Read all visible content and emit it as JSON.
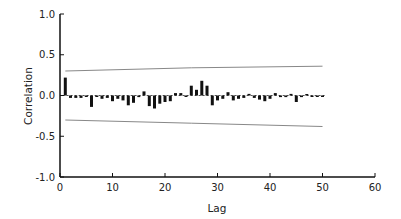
{
  "chart_data": {
    "type": "bar",
    "title": "",
    "xlabel": "Lag",
    "ylabel": "Correlation",
    "xlim": [
      0,
      60
    ],
    "ylim": [
      -1.0,
      1.0
    ],
    "xticks": [
      0,
      10,
      20,
      30,
      40,
      50,
      60
    ],
    "yticks": [
      -1.0,
      -0.5,
      0.0,
      0.5,
      1.0
    ],
    "ytick_labels": [
      "-1.0",
      "-0.5",
      "0.0",
      "0.5",
      "1.0"
    ],
    "grid": false,
    "legend": null,
    "zero_line": "dashed",
    "lags": [
      1,
      2,
      3,
      4,
      5,
      6,
      7,
      8,
      9,
      10,
      11,
      12,
      13,
      14,
      15,
      16,
      17,
      18,
      19,
      20,
      21,
      22,
      23,
      24,
      25,
      26,
      27,
      28,
      29,
      30,
      31,
      32,
      33,
      34,
      35,
      36,
      37,
      38,
      39,
      40,
      41,
      42,
      43,
      44,
      45,
      46,
      47,
      48,
      49,
      50
    ],
    "values": [
      0.22,
      -0.03,
      -0.03,
      -0.03,
      -0.01,
      -0.14,
      -0.01,
      -0.04,
      -0.03,
      -0.07,
      -0.04,
      -0.06,
      -0.12,
      -0.09,
      -0.02,
      0.05,
      -0.13,
      -0.16,
      -0.1,
      -0.08,
      -0.07,
      0.03,
      0.03,
      -0.01,
      0.12,
      0.07,
      0.18,
      0.12,
      -0.12,
      -0.06,
      -0.04,
      0.04,
      -0.06,
      -0.04,
      -0.03,
      0.02,
      -0.03,
      -0.05,
      -0.07,
      -0.04,
      0.03,
      -0.02,
      -0.02,
      0.02,
      -0.08,
      -0.02,
      0.01,
      -0.01,
      -0.01,
      -0.01
    ],
    "confidence_band": {
      "upper": {
        "x": [
          1,
          25,
          50
        ],
        "y": [
          0.3,
          0.34,
          0.36
        ]
      },
      "lower": {
        "x": [
          1,
          25,
          50
        ],
        "y": [
          -0.3,
          -0.34,
          -0.38
        ]
      }
    }
  }
}
